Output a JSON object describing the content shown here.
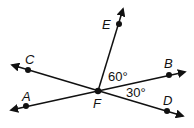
{
  "points": {
    "A": {
      "label": "A"
    },
    "B": {
      "label": "B"
    },
    "C": {
      "label": "C"
    },
    "D": {
      "label": "D"
    },
    "E": {
      "label": "E"
    },
    "F": {
      "label": "F"
    }
  },
  "angles": {
    "EFB": "60°",
    "BFD": "30°"
  },
  "colors": {
    "stroke": "#111111",
    "background": "#ffffff"
  }
}
